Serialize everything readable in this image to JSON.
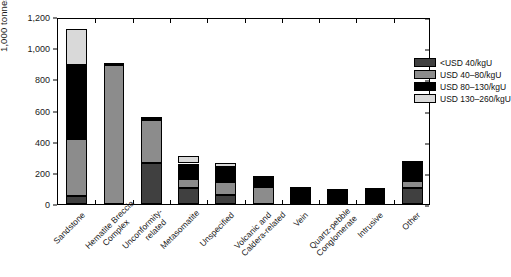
{
  "chart_data": {
    "type": "bar",
    "subtype": "stacked-bar",
    "title": "",
    "xlabel": "",
    "ylabel": "1,000 tonnes U",
    "ylim": [
      0,
      1200
    ],
    "ytick_labels": [
      "0",
      "200",
      "400",
      "600",
      "800",
      "1,000",
      "1,200"
    ],
    "ytick_values": [
      0,
      200,
      400,
      600,
      800,
      1000,
      1200
    ],
    "grid": false,
    "legend_position": "top-right",
    "categories": [
      "Sandstone",
      "Hematite Breccia Complex",
      "Unconformity-related",
      "Metasomatite",
      "Unspecified",
      "Volcanic and Caldera-related",
      "Vein",
      "Quartz-pebble Conglomerate",
      "Intrusive",
      "Other"
    ],
    "category_lines": [
      [
        "Sandstone"
      ],
      [
        "Hematite Breccia",
        "Complex"
      ],
      [
        "Unconformity-",
        "related"
      ],
      [
        "Metasomatite"
      ],
      [
        "Unspecified"
      ],
      [
        "Volcanic and",
        "Caldera-related"
      ],
      [
        "Vein"
      ],
      [
        "Quartz-pebble",
        "Conglomerate"
      ],
      [
        "Intrusive"
      ],
      [
        "Other"
      ]
    ],
    "series": [
      {
        "name": "<USD 40/kgU",
        "color": "#404040",
        "values": [
          50,
          0,
          265,
          100,
          55,
          0,
          0,
          0,
          0,
          100
        ]
      },
      {
        "name": "USD 40-80/kgU",
        "color": "#8c8c8c",
        "values": [
          370,
          890,
          275,
          60,
          85,
          110,
          0,
          0,
          0,
          50
        ]
      },
      {
        "name": "USD 80-130/kgU",
        "color": "#000000",
        "values": [
          470,
          15,
          20,
          100,
          100,
          55,
          95,
          85,
          88,
          115
        ]
      },
      {
        "name": "USD 130-260/kgU",
        "color": "#d9d9d9",
        "values": [
          230,
          0,
          0,
          45,
          25,
          10,
          15,
          5,
          2,
          10
        ]
      }
    ],
    "totals": [
      1120,
      905,
      560,
      305,
      265,
      175,
      110,
      90,
      90,
      275
    ]
  },
  "legend": {
    "items": [
      {
        "label": "<USD 40/kgU",
        "color": "#404040"
      },
      {
        "label": "USD 40–80/kgU",
        "color": "#8c8c8c"
      },
      {
        "label": "USD 80–130/kgU",
        "color": "#000000"
      },
      {
        "label": "USD 130–260/kgU",
        "color": "#d9d9d9"
      }
    ]
  },
  "axis": {
    "y_title": "1,000 tonnes U"
  }
}
